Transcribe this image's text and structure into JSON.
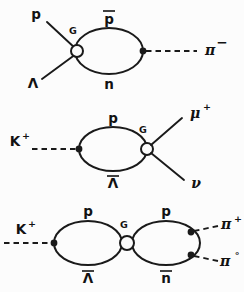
{
  "figure": {
    "background_color": "#fcfcfc",
    "ink_color": "#1a1a1a",
    "width": 244,
    "height": 292
  },
  "diagrams": [
    {
      "id": "diagram-1",
      "vertex_label": "G",
      "incoming": [
        {
          "name": "proton",
          "label": "p",
          "line_style": "solid"
        },
        {
          "name": "lambda",
          "label": "Λ",
          "line_style": "solid"
        }
      ],
      "loop": {
        "top": {
          "name": "antiproton",
          "label": "p",
          "overbar": true
        },
        "bottom": {
          "name": "neutron",
          "label": "n",
          "overbar": false
        }
      },
      "outgoing": [
        {
          "name": "pion-minus",
          "label": "π",
          "superscript": "−",
          "line_style": "dashed"
        }
      ]
    },
    {
      "id": "diagram-2",
      "vertex_label": "G",
      "incoming": [
        {
          "name": "kaon-plus",
          "label": "K",
          "superscript": "+",
          "line_style": "dashed"
        }
      ],
      "loop": {
        "top": {
          "name": "proton",
          "label": "p",
          "overbar": false
        },
        "bottom": {
          "name": "antilambda",
          "label": "Λ",
          "overbar": true
        }
      },
      "outgoing": [
        {
          "name": "muon-plus",
          "label": "μ",
          "superscript": "+",
          "line_style": "solid"
        },
        {
          "name": "neutrino",
          "label": "ν",
          "superscript": "",
          "line_style": "solid"
        }
      ]
    },
    {
      "id": "diagram-3",
      "vertex_label": "G",
      "incoming": [
        {
          "name": "kaon-plus",
          "label": "K",
          "superscript": "+",
          "line_style": "dashed"
        }
      ],
      "loop_left": {
        "top": {
          "name": "proton",
          "label": "p",
          "overbar": false
        },
        "bottom": {
          "name": "antilambda",
          "label": "Λ",
          "overbar": true
        }
      },
      "loop_right": {
        "top": {
          "name": "proton",
          "label": "p",
          "overbar": false
        },
        "bottom": {
          "name": "antineutron",
          "label": "n",
          "overbar": true
        }
      },
      "outgoing": [
        {
          "name": "pion-plus",
          "label": "π",
          "superscript": "+",
          "line_style": "dashed"
        },
        {
          "name": "pion-zero",
          "label": "π",
          "superscript": "°",
          "line_style": "dashed"
        }
      ]
    }
  ],
  "labels": {
    "d1_in_p": "p",
    "d1_in_lambda": "Λ",
    "d1_vertex": "G",
    "d1_loop_top": "p",
    "d1_loop_bottom": "n",
    "d1_out_pi": "π",
    "d1_out_pi_sup": "−",
    "d2_in_k": "K",
    "d2_in_k_sup": "+",
    "d2_loop_top": "p",
    "d2_loop_bottom": "Λ",
    "d2_vertex": "G",
    "d2_out_mu": "μ",
    "d2_out_mu_sup": "+",
    "d2_out_nu": "ν",
    "d3_in_k": "K",
    "d3_in_k_sup": "+",
    "d3_loopL_top": "p",
    "d3_loopL_bottom": "Λ",
    "d3_vertex": "G",
    "d3_loopR_top": "p",
    "d3_loopR_bottom": "n",
    "d3_out_piplus": "π",
    "d3_out_piplus_sup": "+",
    "d3_out_pizero": "π",
    "d3_out_pizero_sup": "°"
  }
}
